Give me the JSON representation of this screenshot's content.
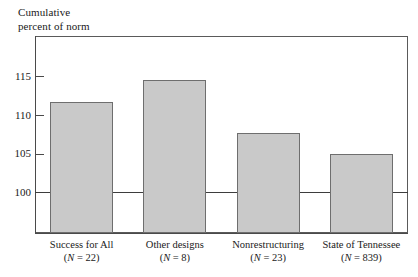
{
  "figure": {
    "axis_title_line1": "Cumulative",
    "axis_title_line2": "percent of norm"
  },
  "chart_data": {
    "type": "bar",
    "title": "",
    "subtitle": "",
    "xlabel": "",
    "ylabel": "Cumulative percent of norm",
    "categories": [
      "Success for All",
      "Other designs",
      "Nonrestructuring",
      "State of Tennessee"
    ],
    "category_sublabels": [
      "(N = 22)",
      "(N = 8)",
      "(N = 23)",
      "(N = 839)"
    ],
    "n_values": [
      22,
      8,
      23,
      839
    ],
    "values": [
      111.8,
      114.6,
      107.7,
      105.0
    ],
    "ylim": [
      95.5,
      117.5
    ],
    "yticks": [
      100,
      105,
      110,
      115
    ],
    "ytick_labels": [
      "100",
      "105",
      "110",
      "115"
    ],
    "reference_line": 100,
    "grid": false,
    "legend": "none",
    "bar_fill_color": "#c9c9c9",
    "bar_border_color": "#6e6e6e",
    "axis_color": "#4a4a4a",
    "frame_color": "#5a5a5a"
  }
}
